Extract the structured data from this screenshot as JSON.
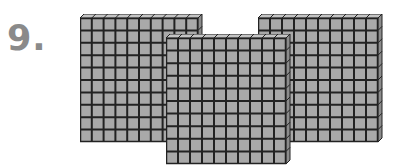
{
  "problem": {
    "number_label": "9.",
    "description": "Base-ten blocks: three hundred-flats",
    "blocks": [
      {
        "type": "hundred-flat",
        "rows": 10,
        "cols": 10,
        "value": 100
      },
      {
        "type": "hundred-flat",
        "rows": 10,
        "cols": 10,
        "value": 100
      },
      {
        "type": "hundred-flat",
        "rows": 10,
        "cols": 10,
        "value": 100
      }
    ],
    "colors": {
      "fill": "#a9a9a9",
      "grid_line": "#222222",
      "top_face": "#c4c4c4",
      "side_face": "#8c8c8c",
      "label": "#8a8a8a"
    }
  }
}
